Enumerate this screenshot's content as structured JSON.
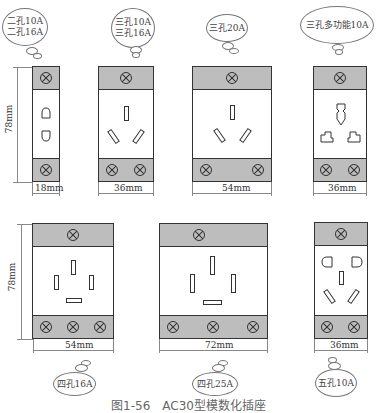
{
  "figure": {
    "caption": "图1-56　AC30型模数化插座",
    "colors": {
      "band": "#bdbdbd",
      "outline": "#333333",
      "dimension": "#888888"
    }
  },
  "top_row": {
    "height_dimension": "78mm",
    "modules": [
      {
        "bubble_lines": [
          "二孔10A",
          "二孔16A"
        ],
        "width_label": "18mm",
        "type": "two-pin"
      },
      {
        "bubble_lines": [
          "三孔10A",
          "三孔16A"
        ],
        "width_label": "36mm",
        "type": "three-pin"
      },
      {
        "bubble_lines": [
          "三孔20A"
        ],
        "width_label": "54mm",
        "type": "three-pin-large"
      },
      {
        "bubble_lines": [
          "三孔多功能10A"
        ],
        "width_label": "36mm",
        "type": "multi-function"
      }
    ]
  },
  "bottom_row": {
    "height_dimension": "78mm",
    "modules": [
      {
        "bubble_lines": [
          "四孔16A"
        ],
        "width_label": "54mm",
        "type": "four-pin"
      },
      {
        "bubble_lines": [
          "四孔25A"
        ],
        "width_label": "72mm",
        "type": "four-pin-large"
      },
      {
        "bubble_lines": [
          "五孔10A"
        ],
        "width_label": "36mm",
        "type": "five-pin"
      }
    ]
  }
}
